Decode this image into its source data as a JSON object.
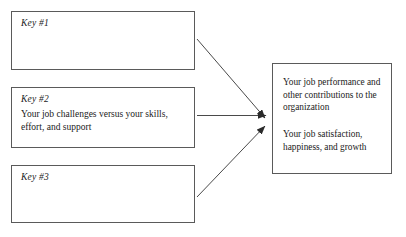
{
  "diagram": {
    "type": "flow-convergence",
    "background_color": "#ffffff",
    "line_color": "#5a5a5a",
    "text_color": "#1a1a1a",
    "inputs": [
      {
        "label": "Key #1",
        "body": ""
      },
      {
        "label": "Key #2",
        "body": "Your job challenges versus your skills, effort, and support"
      },
      {
        "label": "Key #3",
        "body": ""
      }
    ],
    "outcome": {
      "paragraph_1": "Your job performance and other contributions to the organization",
      "paragraph_2": "Your job satisfaction, happiness, and growth"
    },
    "arrows": [
      {
        "name": "arrow-key1-to-outcome",
        "from": "Key #1",
        "to": "outcome",
        "direction": "down-right"
      },
      {
        "name": "arrow-key2-to-outcome",
        "from": "Key #2",
        "to": "outcome",
        "direction": "right"
      },
      {
        "name": "arrow-key3-to-outcome",
        "from": "Key #3",
        "to": "outcome",
        "direction": "up-right"
      }
    ]
  }
}
